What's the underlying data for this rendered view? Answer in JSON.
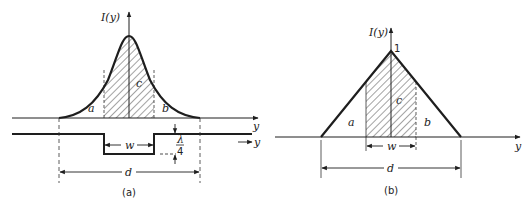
{
  "panels": [
    {
      "id": "a",
      "caption": "(a)",
      "y_axis_label": "I(y)",
      "x_axis_label": "y",
      "curve_shape": "gaussian",
      "region_labels": {
        "left": "a",
        "center": "c",
        "right": "b"
      },
      "width_label": "w",
      "distance_label": "d",
      "step_profile": {
        "depth_label_num": "λ",
        "depth_label_den": "4",
        "axis_label": "y"
      }
    },
    {
      "id": "b",
      "caption": "(b)",
      "y_axis_label": "I(y)",
      "x_axis_label": "y",
      "curve_shape": "triangle",
      "peak_value_label": "1",
      "region_labels": {
        "left": "a",
        "center": "c",
        "right": "b"
      },
      "width_label": "w",
      "distance_label": "d"
    }
  ],
  "colors": {
    "ink": "#1e1e1e",
    "background": "#ffffff"
  }
}
